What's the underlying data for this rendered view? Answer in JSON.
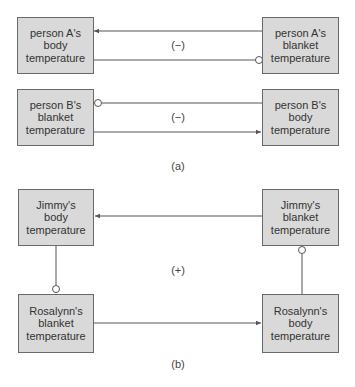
{
  "diagram_a": {
    "caption": "(a)",
    "loop_polarity": "(−)",
    "nodes": {
      "a_body": "person A's\nbody\ntemperature",
      "a_blanket": "person A's\nblanket\ntemperature",
      "b_blanket": "person B's\nblanket\ntemperature",
      "b_body": "person B's\nbody\ntemperature"
    }
  },
  "diagram_b": {
    "caption": "(b)",
    "loop_polarity": "(+)",
    "nodes": {
      "jimmy_body": "Jimmy's\nbody\ntemperature",
      "jimmy_blanket": "Jimmy's\nblanket\ntemperature",
      "rosalynn_blanket": "Rosalynn's\nblanket\ntemperature",
      "rosalynn_body": "Rosalynn's\nbody\ntemperature"
    }
  },
  "colors": {
    "box_fill": "#d9d9d9",
    "box_border": "#6a6a6a",
    "line": "#555555"
  }
}
